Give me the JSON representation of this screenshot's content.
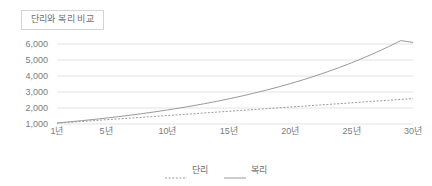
{
  "title": "단리와 복리 비교",
  "colors": {
    "gridline": "#e3e3e3",
    "axis_text": "#7b7b7b",
    "title_text": "#6e6e6e",
    "title_border": "#d4d4d4",
    "simple_line": "#9a9a9a",
    "compound_line": "#9a9a9a",
    "background": "#ffffff"
  },
  "legend": {
    "position": "bottom-center",
    "items": [
      {
        "label": "단리",
        "style": "dotted",
        "icon": "dotted-line-icon"
      },
      {
        "label": "복리",
        "style": "solid",
        "icon": "solid-line-icon"
      }
    ]
  },
  "chart_data": {
    "type": "line",
    "title": "단리와 복리 비교",
    "xlabel": "",
    "ylabel": "",
    "grid": true,
    "legend_position": "bottom-center",
    "xlim": [
      1,
      30
    ],
    "ylim": [
      1000,
      6000
    ],
    "x_tick_labels": [
      "1년",
      "5년",
      "10년",
      "15년",
      "20년",
      "25년",
      "30년"
    ],
    "x_tick_values": [
      1,
      5,
      10,
      15,
      20,
      25,
      30
    ],
    "y_tick_labels": [
      "1,000",
      "2,000",
      "3,000",
      "4,000",
      "5,000",
      "6,000"
    ],
    "y_tick_values": [
      1000,
      2000,
      3000,
      4000,
      5000,
      6000
    ],
    "x": [
      1,
      2,
      3,
      4,
      5,
      6,
      7,
      8,
      9,
      10,
      11,
      12,
      13,
      14,
      15,
      16,
      17,
      18,
      19,
      20,
      21,
      22,
      23,
      24,
      25,
      26,
      27,
      28,
      29,
      30
    ],
    "series": [
      {
        "name": "단리",
        "style": "dotted",
        "values": [
          1053,
          1106,
          1159,
          1212,
          1265,
          1318,
          1371,
          1424,
          1477,
          1530,
          1583,
          1636,
          1689,
          1742,
          1795,
          1848,
          1901,
          1954,
          2007,
          2060,
          2113,
          2166,
          2219,
          2272,
          2325,
          2378,
          2431,
          2484,
          2537,
          2590
        ]
      },
      {
        "name": "복리",
        "style": "solid",
        "values": [
          1065,
          1134,
          1208,
          1286,
          1370,
          1459,
          1554,
          1655,
          1763,
          1877,
          1999,
          2129,
          2267,
          2414,
          2572,
          2739,
          2917,
          3106,
          3308,
          3523,
          3752,
          3996,
          4256,
          4532,
          4827,
          5141,
          5475,
          5831,
          6210,
          6100
        ]
      }
    ]
  }
}
